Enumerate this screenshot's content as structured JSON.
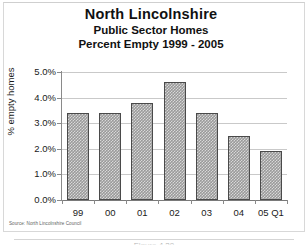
{
  "figure": {
    "source_note": "Source: North Lincolnshire Council",
    "caption_partial": "Figure 4.29"
  },
  "chart_data": {
    "type": "bar",
    "title": "North Lincolnshire",
    "subtitle": "Public Sector Homes",
    "subtitle2": "Percent Empty 1999 - 2005",
    "xlabel": "",
    "ylabel": "% empty homes",
    "categories": [
      "99",
      "00",
      "01",
      "02",
      "03",
      "04",
      "05 Q1"
    ],
    "values": [
      3.4,
      3.4,
      3.8,
      4.6,
      3.4,
      2.5,
      1.9
    ],
    "ylim": [
      0.0,
      5.0
    ],
    "ytick_values": [
      0.0,
      1.0,
      2.0,
      3.0,
      4.0,
      5.0
    ],
    "ytick_labels": [
      "0.0%",
      "1.0%",
      "2.0%",
      "3.0%",
      "4.0%",
      "5.0%"
    ],
    "grid": true,
    "legend": false,
    "bar_color": "#9a9a9a",
    "bar_border_color": "#4a4a4a",
    "gridline_color": "#c9c9c9"
  }
}
